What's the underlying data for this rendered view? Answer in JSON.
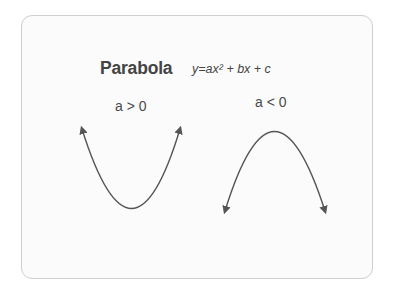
{
  "diagram": {
    "title": "Parabola",
    "formula": "y=ax² + bx + c",
    "cases": [
      {
        "label": "a > 0",
        "shape": "opens-up",
        "vertex": [
          132,
          208
        ],
        "ends": [
          [
            81,
            127
          ],
          [
            181,
            127
          ]
        ]
      },
      {
        "label": "a < 0",
        "shape": "opens-down",
        "vertex": [
          274,
          131
        ],
        "ends": [
          [
            224,
            213
          ],
          [
            326,
            213
          ]
        ]
      }
    ],
    "colors": {
      "stroke": "#555555",
      "text": "#444444",
      "border": "#cfcfcf",
      "background": "#fbfbfb"
    }
  }
}
